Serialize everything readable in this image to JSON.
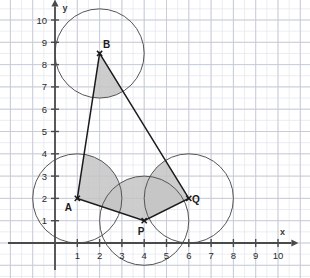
{
  "figure": {
    "background_color": "#ffffff",
    "grid_minor_color": "#e4e8ef",
    "grid_major_color": "#c3cad6",
    "axis_color": "#4a4a4a",
    "stroke_color": "#1a1a1a",
    "circle_color": "#555555",
    "sector_fill": "#c4c4c4"
  },
  "axes": {
    "x_label": "x",
    "y_label": "y",
    "x_ticks": [
      "1",
      "2",
      "3",
      "4",
      "5",
      "6",
      "7",
      "8",
      "9",
      "10"
    ],
    "y_ticks": [
      "1",
      "2",
      "3",
      "4",
      "5",
      "6",
      "7",
      "8",
      "9",
      "10"
    ],
    "x_range": [
      0,
      10.6
    ],
    "y_range": [
      0,
      10.6
    ],
    "origin_px": {
      "x": 55,
      "y": 243
    },
    "unit_px": 22.3
  },
  "chart_data": {
    "type": "scatter",
    "title": "",
    "xlabel": "x",
    "ylabel": "y",
    "xlim": [
      0,
      10.6
    ],
    "ylim": [
      0,
      10.6
    ],
    "grid": true,
    "legend": "none",
    "points": [
      {
        "name": "A",
        "x": 1,
        "y": 2,
        "label": "A",
        "label_dx": -9,
        "label_dy": 13
      },
      {
        "name": "B",
        "x": 2,
        "y": 8.5,
        "label": "B",
        "label_dx": 7,
        "label_dy": -5
      },
      {
        "name": "P",
        "x": 4,
        "y": 1,
        "label": "P",
        "label_dx": -3,
        "label_dy": 14
      },
      {
        "name": "Q",
        "x": 6,
        "y": 2,
        "label": "Q",
        "label_dx": 7,
        "label_dy": 5
      }
    ],
    "polygon": [
      "A",
      "B",
      "Q",
      "P"
    ],
    "circles": [
      {
        "center": "A",
        "cx": 1,
        "cy": 2,
        "r": 2
      },
      {
        "center": "B",
        "cx": 2,
        "cy": 8.5,
        "r": 2
      },
      {
        "center": "P",
        "cx": 4,
        "cy": 1,
        "r": 2
      },
      {
        "center": "Q",
        "cx": 6,
        "cy": 2,
        "r": 2
      }
    ],
    "angle_sectors": [
      {
        "vertex": "A",
        "from": "P",
        "to": "B",
        "radius": 2
      },
      {
        "vertex": "B",
        "from": "A",
        "to": "Q",
        "radius": 2
      },
      {
        "vertex": "P",
        "from": "Q",
        "to": "A",
        "radius": 2
      },
      {
        "vertex": "Q",
        "from": "B",
        "to": "P",
        "radius": 2
      }
    ]
  }
}
